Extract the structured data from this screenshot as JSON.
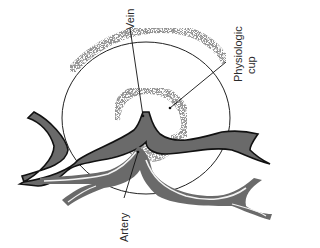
{
  "figure": {
    "labels": {
      "vein": "Vein",
      "cup_line1": "Physiologic",
      "cup_line2": "cup",
      "artery": "Artery"
    },
    "colors": {
      "vessel_fill": "#6a6a6a",
      "vein_outline": "#111111",
      "artery_highlight": "#f2f2f2",
      "disc_outline": "#222222",
      "stipple": "#555555",
      "background": "#ffffff"
    }
  }
}
